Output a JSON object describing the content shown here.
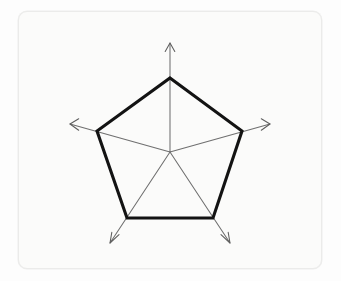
{
  "figure": {
    "title": "",
    "background_color": "#fdfdfd",
    "card_color": "#fbfbfa",
    "card_border_color": "#ebebea"
  },
  "chart_data": {
    "type": "radar",
    "title": "",
    "subtitle": "",
    "xlabel": "",
    "ylabel": "",
    "grid": false,
    "legend": "none",
    "axis_count": 5,
    "axis_arrowheads": true,
    "categories": [
      "Axis 1",
      "Axis 2",
      "Axis 3",
      "Axis 4",
      "Axis 5"
    ],
    "tick_labels": [],
    "rlim": [
      0,
      1.47
    ],
    "axis_angles_deg": [
      90,
      18,
      -54,
      -126,
      162
    ],
    "series": [
      {
        "name": "Series 1",
        "values": [
          1,
          1,
          1,
          1,
          1
        ],
        "color": "#131313",
        "line_width": 3.1,
        "fill": "none",
        "closed": true
      }
    ],
    "geometry": {
      "center": {
        "x": 170,
        "y": 152
      },
      "data_radius": 74,
      "axis_radius": 109,
      "vertices": [
        {
          "label": "Axis 1",
          "x": 170,
          "y": 78
        },
        {
          "label": "Axis 2",
          "x": 242,
          "y": 131
        },
        {
          "label": "Axis 3",
          "x": 213,
          "y": 218
        },
        {
          "label": "Axis 4",
          "x": 127,
          "y": 218
        },
        {
          "label": "Axis 5",
          "x": 97,
          "y": 131
        }
      ],
      "axis_tips": [
        {
          "label": "Axis 1",
          "x": 170,
          "y": 43
        },
        {
          "label": "Axis 2",
          "x": 270,
          "y": 124
        },
        {
          "label": "Axis 3",
          "x": 230,
          "y": 243
        },
        {
          "label": "Axis 4",
          "x": 110,
          "y": 243
        },
        {
          "label": "Axis 5",
          "x": 70,
          "y": 124
        }
      ]
    }
  },
  "annotations": {
    "polygon_points": "170,78 242,131 213,218 127,218 97,131",
    "axis_1_path": "M170,152 L170,43",
    "axis_2_path": "M170,152 L270,124",
    "axis_3_path": "M170,152 L230,243",
    "axis_4_path": "M170,152 L110,243",
    "axis_5_path": "M170,152 L70,124",
    "axis_1_head": "M165.2,51.5 L170,43 L174.8,51.5",
    "axis_2_head": "M261.3,118.7 L270,124 L261.3,130.2",
    "axis_3_head": "M221.0,234.6 L230,243 L228.2,232.3",
    "axis_4_head": "M119.0,234.6 L110,243 L111.8,232.3",
    "axis_5_head": "M78.7,118.7 L70,124 L78.7,130.2"
  }
}
